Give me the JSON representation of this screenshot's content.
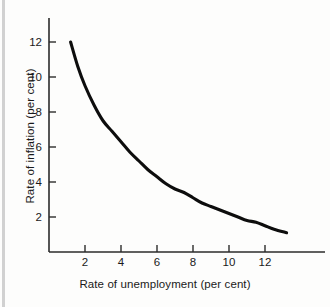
{
  "chart_data": {
    "type": "line",
    "title": "",
    "xlabel": "Rate of unemployment (per cent)",
    "ylabel": "Rate of inflation (per cent)",
    "xlim": [
      0,
      14
    ],
    "ylim": [
      0,
      13
    ],
    "grid": false,
    "legend": null,
    "x_ticks": [
      2,
      4,
      6,
      8,
      10,
      12
    ],
    "x_tick_labels": [
      "2",
      "4",
      "6",
      "8",
      "10",
      "12"
    ],
    "y_ticks": [
      2,
      4,
      6,
      8,
      10,
      12
    ],
    "y_tick_labels": [
      "2",
      "4",
      "6",
      "8",
      "10",
      "12"
    ],
    "series": [
      {
        "name": "Phillips curve",
        "color": "#0d0d0d",
        "x": [
          1.2,
          1.6,
          2.0,
          2.5,
          3.0,
          3.5,
          4.0,
          4.5,
          5.0,
          5.5,
          6.0,
          6.5,
          7.0,
          7.5,
          8.0,
          8.5,
          9.0,
          9.5,
          10.0,
          10.5,
          11.0,
          11.5,
          12.0,
          12.5,
          13.2
        ],
        "y": [
          12.0,
          10.6,
          9.5,
          8.4,
          7.5,
          6.9,
          6.3,
          5.7,
          5.2,
          4.7,
          4.3,
          3.9,
          3.6,
          3.4,
          3.1,
          2.8,
          2.6,
          2.4,
          2.2,
          2.0,
          1.8,
          1.7,
          1.5,
          1.3,
          1.1
        ]
      }
    ]
  },
  "axes": {
    "x_title": "Rate of unemployment (per cent)",
    "y_title": "Rate of inflation (per cent)"
  },
  "ticks": {
    "x": [
      "2",
      "4",
      "6",
      "8",
      "10",
      "12"
    ],
    "y": [
      "2",
      "4",
      "6",
      "8",
      "10",
      "12"
    ]
  },
  "colors": {
    "curve": "#0d0d0d",
    "axis": "#2b2b2b",
    "background": "#fdfdfc",
    "text": "#1a1a1a"
  }
}
